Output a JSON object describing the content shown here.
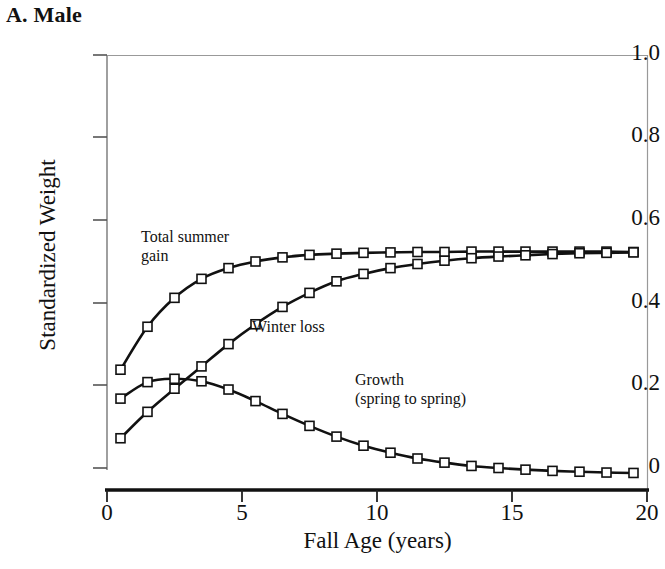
{
  "panel": {
    "title": "A. Male"
  },
  "axes": {
    "xlabel": "Fall Age (years)",
    "ylabel": "Standardized Weight",
    "xticks": [
      "0",
      "5",
      "10",
      "15",
      "20"
    ],
    "yticks": [
      "1.0",
      "0.8",
      "0.6",
      "0.4",
      "0.2",
      "0"
    ]
  },
  "annotations": {
    "summer_line1": "Total summer",
    "summer_line2": "gain",
    "winter": "Winter loss",
    "growth_line1": "Growth",
    "growth_line2": "(spring to spring)"
  },
  "colors": {
    "line": "#111111",
    "marker_fill": "#ffffff",
    "marker_stroke": "#111111",
    "axis": "#555555",
    "background": "#ffffff"
  },
  "chart_data": {
    "type": "line",
    "title": "A. Male",
    "xlabel": "Fall Age (years)",
    "ylabel": "Standardized Weight",
    "xlim": [
      0,
      20
    ],
    "ylim": [
      -0.05,
      1.0
    ],
    "grid": false,
    "legend": "inline-annotations",
    "marker": "open-square",
    "x": [
      0.5,
      1.5,
      2.5,
      3.5,
      4.5,
      5.5,
      6.5,
      7.5,
      8.5,
      9.5,
      10.5,
      11.5,
      12.5,
      13.5,
      14.5,
      15.5,
      16.5,
      17.5,
      18.5,
      19.5
    ],
    "series": [
      {
        "name": "Total summer gain",
        "values": [
          0.238,
          0.342,
          0.412,
          0.458,
          0.484,
          0.5,
          0.51,
          0.516,
          0.519,
          0.521,
          0.522,
          0.523,
          0.523,
          0.524,
          0.524,
          0.524,
          0.524,
          0.524,
          0.524,
          0.523
        ]
      },
      {
        "name": "Winter loss",
        "values": [
          0.072,
          0.136,
          0.192,
          0.246,
          0.3,
          0.348,
          0.39,
          0.424,
          0.452,
          0.47,
          0.484,
          0.494,
          0.502,
          0.508,
          0.512,
          0.515,
          0.518,
          0.52,
          0.521,
          0.522
        ]
      },
      {
        "name": "Growth (spring to spring)",
        "values": [
          0.168,
          0.208,
          0.216,
          0.21,
          0.19,
          0.162,
          0.131,
          0.102,
          0.076,
          0.054,
          0.037,
          0.023,
          0.013,
          0.005,
          0.0,
          -0.004,
          -0.007,
          -0.009,
          -0.011,
          -0.012
        ]
      }
    ]
  }
}
